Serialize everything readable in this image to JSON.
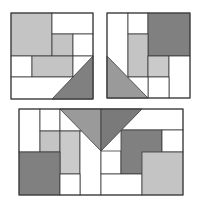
{
  "colors": {
    "stroke": "#3a3a3a",
    "white": "#ffffff",
    "light": "#c4c4c4",
    "lighter": "#cacaca",
    "dark": "#808080",
    "medium": "#9a9a9a",
    "medium_dark": "#7a7a7a"
  },
  "panels": [
    {
      "name": "panel-top-left",
      "bounds": [
        11,
        13,
        82,
        86
      ],
      "rects": [
        {
          "name": "large-light-square",
          "x": 11,
          "y": 13,
          "w": 41,
          "h": 43,
          "fill": "light"
        },
        {
          "name": "white-cell-top-right",
          "x": 52,
          "y": 13,
          "w": 41,
          "h": 21,
          "fill": "white"
        },
        {
          "name": "small-light-square",
          "x": 52,
          "y": 34,
          "w": 21,
          "h": 22,
          "fill": "light"
        },
        {
          "name": "white-cell-mid-right",
          "x": 73,
          "y": 34,
          "w": 20,
          "h": 22,
          "fill": "white"
        },
        {
          "name": "white-cell-mid-left",
          "x": 11,
          "y": 56,
          "w": 21,
          "h": 21,
          "fill": "white"
        },
        {
          "name": "wide-light-rect",
          "x": 32,
          "y": 56,
          "w": 41,
          "h": 21,
          "fill": "light"
        },
        {
          "name": "white-cell-mid-far-right",
          "x": 73,
          "y": 56,
          "w": 20,
          "h": 21,
          "fill": "white"
        },
        {
          "name": "white-bottom-row",
          "x": 11,
          "y": 77,
          "w": 82,
          "h": 22,
          "fill": "white"
        }
      ],
      "triangles": [
        {
          "name": "dark-triangle",
          "points": "52,99 93,56 93,99",
          "fill": "dark"
        }
      ]
    },
    {
      "name": "panel-top-right",
      "bounds": [
        107,
        13,
        83,
        85
      ],
      "rects": [
        {
          "name": "white-tall-left",
          "x": 107,
          "y": 13,
          "w": 21,
          "h": 85,
          "fill": "white"
        },
        {
          "name": "white-cell-top",
          "x": 128,
          "y": 13,
          "w": 20,
          "h": 21,
          "fill": "white"
        },
        {
          "name": "dark-square",
          "x": 148,
          "y": 13,
          "w": 42,
          "h": 43,
          "fill": "dark"
        },
        {
          "name": "tall-light-rect",
          "x": 128,
          "y": 34,
          "w": 20,
          "h": 43,
          "fill": "light"
        },
        {
          "name": "small-lighter-square",
          "x": 148,
          "y": 56,
          "w": 21,
          "h": 21,
          "fill": "lighter"
        },
        {
          "name": "white-cell-right",
          "x": 169,
          "y": 56,
          "w": 21,
          "h": 42,
          "fill": "white"
        },
        {
          "name": "white-cell-bottom-mid",
          "x": 148,
          "y": 77,
          "w": 21,
          "h": 21,
          "fill": "white"
        },
        {
          "name": "white-cell-bottom-left",
          "x": 128,
          "y": 77,
          "w": 20,
          "h": 21,
          "fill": "white"
        }
      ],
      "triangles": [
        {
          "name": "medium-triangle",
          "points": "107,56 148,98 107,98",
          "fill": "medium"
        }
      ]
    },
    {
      "name": "panel-bottom",
      "bounds": [
        19,
        109,
        164,
        86
      ],
      "rects": [
        {
          "name": "white-tall-left",
          "x": 19,
          "y": 109,
          "w": 21,
          "h": 43,
          "fill": "white"
        },
        {
          "name": "white-cell-top-a",
          "x": 40,
          "y": 109,
          "w": 20,
          "h": 22,
          "fill": "white"
        },
        {
          "name": "white-cell-top-b",
          "x": 60,
          "y": 109,
          "w": 41,
          "h": 22,
          "fill": "white"
        },
        {
          "name": "white-cell-top-c",
          "x": 101,
          "y": 109,
          "w": 82,
          "h": 21,
          "fill": "white"
        },
        {
          "name": "small-light-square",
          "x": 40,
          "y": 131,
          "w": 20,
          "h": 21,
          "fill": "light"
        },
        {
          "name": "tall-lighter-rect",
          "x": 60,
          "y": 131,
          "w": 20,
          "h": 43,
          "fill": "lighter"
        },
        {
          "name": "white-tall-center",
          "x": 80,
          "y": 131,
          "w": 21,
          "h": 64,
          "fill": "white"
        },
        {
          "name": "white-cell-center-right",
          "x": 101,
          "y": 151,
          "w": 20,
          "h": 23,
          "fill": "white"
        },
        {
          "name": "dark-l-rect",
          "x": 121,
          "y": 130,
          "w": 41,
          "h": 44,
          "fill": "dark"
        },
        {
          "name": "white-cell-right-top",
          "x": 162,
          "y": 130,
          "w": 21,
          "h": 22,
          "fill": "white"
        },
        {
          "name": "large-dark-square",
          "x": 19,
          "y": 152,
          "w": 41,
          "h": 43,
          "fill": "dark"
        },
        {
          "name": "white-cell-bottom-a",
          "x": 60,
          "y": 174,
          "w": 20,
          "h": 21,
          "fill": "white"
        },
        {
          "name": "white-cell-bottom-b",
          "x": 101,
          "y": 174,
          "w": 41,
          "h": 21,
          "fill": "white"
        },
        {
          "name": "large-light-square",
          "x": 142,
          "y": 152,
          "w": 41,
          "h": 43,
          "fill": "light"
        }
      ],
      "triangles": [
        {
          "name": "v-triangle-left-half",
          "points": "60,109 101,109 101,151",
          "fill": "medium"
        },
        {
          "name": "v-triangle-right-half",
          "points": "101,109 142,109 101,151",
          "fill": "medium_dark"
        }
      ]
    }
  ]
}
